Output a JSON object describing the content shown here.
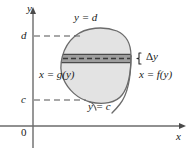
{
  "figure": {
    "axes": {
      "y_axis_label": "y",
      "x_axis_label": "x",
      "origin_label": "0"
    },
    "tick_labels": {
      "upper": "d",
      "lower": "c"
    },
    "curve_labels": {
      "top": "y = d",
      "bottom": "y = c",
      "left": "x = g(y)",
      "right": "x = f(y)"
    },
    "strip": {
      "thickness_label": "Δy",
      "thickness_symbol": "Δ",
      "thickness_variable": "y"
    },
    "colors": {
      "region_fill": "#e3e3e3",
      "strip_fill": "#9e9e9e",
      "curve_stroke": "#6b6b6b",
      "axis_stroke": "#6b6b6b",
      "dashed_stroke": "#8c8c8c",
      "text": "#1a1a1a"
    },
    "geometry": {
      "y_axis_x": 33,
      "x_axis_y": 126,
      "d_line_y": 36,
      "c_line_y": 100,
      "strip_top_y": 54,
      "strip_bottom_y": 63
    }
  }
}
